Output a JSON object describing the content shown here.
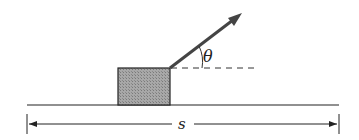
{
  "diagram": {
    "labels": {
      "angle": "θ",
      "displacement": "s"
    },
    "colors": {
      "line": "#222222",
      "block_fill": "#9a9a9a",
      "arrow": "#444444",
      "background": "#ffffff"
    },
    "elements": {
      "ground": {
        "x1": 27,
        "x2": 339,
        "y": 105
      },
      "block": {
        "x": 118,
        "y": 68,
        "width": 52,
        "height": 37
      },
      "force_arrow": {
        "x1": 170,
        "y1": 68,
        "x2": 242,
        "y2": 13
      },
      "reference_dash": {
        "x1": 170,
        "x2": 258,
        "y": 68
      },
      "dimension": {
        "x1": 27,
        "x2": 339,
        "y": 124
      }
    }
  }
}
